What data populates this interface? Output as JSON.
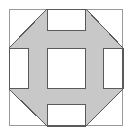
{
  "figure": {
    "canvas": {
      "width": 132,
      "height": 138,
      "background": "#ffffff"
    },
    "colors": {
      "fill_gray": "#c8c8c8",
      "fill_white": "#ffffff",
      "stroke": "#5a5a5a",
      "frame_stroke": "#9a9a9a"
    },
    "stroke_width": 1,
    "frame": {
      "x": 9,
      "y": 9,
      "width": 114,
      "height": 117
    },
    "octagon_points": "47,9 86,9 123,48 123,89 86,126 47,126 9,89 9,48",
    "center_square": {
      "x": 47,
      "y": 48,
      "width": 39,
      "height": 41
    },
    "notches": [
      {
        "name": "top-notch",
        "x": 47,
        "y": 9,
        "width": 39,
        "height": 22
      },
      {
        "name": "bottom-notch",
        "x": 47,
        "y": 104,
        "width": 39,
        "height": 22
      },
      {
        "name": "left-notch",
        "x": 9,
        "y": 48,
        "width": 20,
        "height": 41
      },
      {
        "name": "right-notch",
        "x": 103,
        "y": 48,
        "width": 20,
        "height": 41
      }
    ]
  }
}
